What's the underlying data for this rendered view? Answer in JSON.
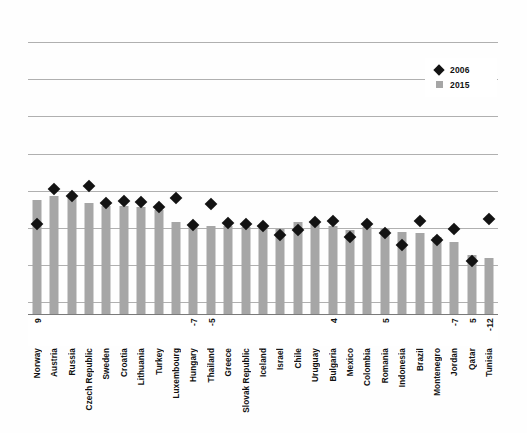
{
  "chart_data": {
    "type": "bar",
    "title": "",
    "subtitle": "",
    "xlabel": "",
    "ylabel": "",
    "grid": true,
    "legend_position": "top-right",
    "ylim": [
      0,
      8
    ],
    "gridline_count": 8,
    "categories": [
      "Norway",
      "Austria",
      "Russia",
      "Czech Republic",
      "Sweden",
      "Croatia",
      "Lithuania",
      "Turkey",
      "Luxembourg",
      "Hungary",
      "Thailand",
      "Greece",
      "Slovak Republic",
      "Iceland",
      "Israel",
      "Chile",
      "Uruguay",
      "Bulgaria",
      "Mexico",
      "Colombia",
      "Romania",
      "Indonesia",
      "Brazil",
      "Montenegro",
      "Jordan",
      "Qatar",
      "Tunisia"
    ],
    "series": [
      {
        "name": "2015",
        "marker": "square",
        "color": "#a6a6a6",
        "values": [
          2.97,
          3.05,
          3.02,
          2.88,
          2.8,
          2.8,
          2.77,
          2.7,
          2.38,
          2.33,
          2.29,
          2.29,
          2.26,
          2.24,
          2.21,
          2.38,
          2.35,
          2.28,
          2.18,
          2.26,
          2.22,
          2.14,
          2.12,
          2.0,
          1.88,
          1.55,
          1.47
        ]
      },
      {
        "name": "2006",
        "marker": "diamond",
        "color": "#131313",
        "values": [
          2.35,
          3.23,
          3.05,
          3.32,
          2.88,
          2.94,
          2.91,
          2.77,
          3.02,
          2.32,
          2.85,
          2.36,
          2.33,
          2.28,
          2.05,
          2.19,
          2.38,
          2.42,
          2.0,
          2.33,
          2.12,
          1.81,
          2.41,
          1.92,
          2.21,
          1.38,
          2.48
        ]
      }
    ],
    "point_labels": [
      {
        "category": "Norway",
        "text": "9"
      },
      {
        "category": "Hungary",
        "text": "-7"
      },
      {
        "category": "Thailand",
        "text": "-5"
      },
      {
        "category": "Bulgaria",
        "text": "4"
      },
      {
        "category": "Romania",
        "text": "5"
      },
      {
        "category": "Jordan",
        "text": "-7"
      },
      {
        "category": "Qatar",
        "text": "5"
      },
      {
        "category": "Tunisia",
        "text": "-12"
      }
    ]
  },
  "legend": {
    "items": [
      {
        "label": "2006",
        "swatch": "diamond-marker-icon"
      },
      {
        "label": "2015",
        "swatch": "square-swatch-icon"
      }
    ]
  }
}
